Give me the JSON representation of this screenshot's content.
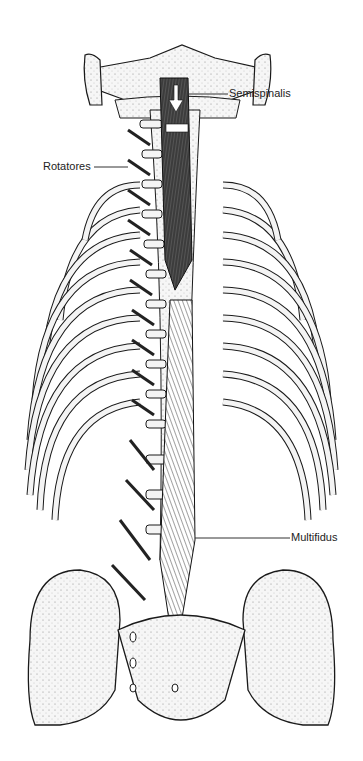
{
  "figure": {
    "labels": {
      "semispinalis": "Semispinalis",
      "rotatores": "Rotatores",
      "multifidus": "Multifidus"
    }
  },
  "colors": {
    "background": "#ffffff",
    "bone_fill": "#f4f4f4",
    "outline": "#1a1a1a",
    "muscle": "#3a3a3a"
  }
}
